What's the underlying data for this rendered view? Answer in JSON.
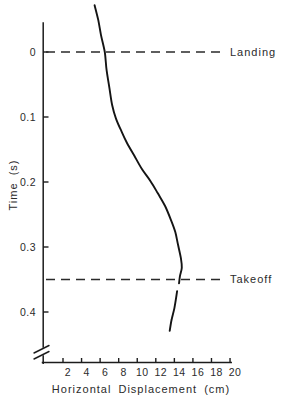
{
  "figure": {
    "kind": "scanned-biomechanics-line-graph",
    "background": "#ffffff",
    "ink_color": "#1c1c1c",
    "text_color": "#2b2b2b"
  },
  "chart_data": {
    "type": "line",
    "title": "",
    "xlabel": "Horizontal Displacement (cm)",
    "ylabel": "Time (s)",
    "xlim": [
      2,
      20
    ],
    "ylim": [
      -0.08,
      0.45
    ],
    "y_axis_direction": "time-increases-downward",
    "y_axis_break_before_x_axis": true,
    "grid": false,
    "legend": "none",
    "x_ticks": [
      2,
      4,
      6,
      8,
      10,
      12,
      14,
      16,
      18,
      20
    ],
    "x_tick_labels": [
      "2",
      "4",
      "6",
      "8",
      "10",
      "12",
      "14",
      "16",
      "18",
      "20"
    ],
    "y_ticks": [
      0,
      0.1,
      0.2,
      0.3,
      0.4
    ],
    "y_tick_labels": [
      "0",
      "0.1",
      "0.2",
      "0.3",
      "0.4"
    ],
    "point_format": [
      "time_s",
      "displacement_cm"
    ],
    "series": [
      {
        "name": "displacement-before-and-during-contact",
        "points": [
          [
            -0.072,
            5.4
          ],
          [
            -0.049,
            5.8
          ],
          [
            -0.026,
            6.1
          ],
          [
            0.0,
            6.5
          ],
          [
            0.028,
            6.7
          ],
          [
            0.055,
            7.0
          ],
          [
            0.082,
            7.3
          ],
          [
            0.102,
            7.7
          ],
          [
            0.122,
            8.3
          ],
          [
            0.14,
            8.9
          ],
          [
            0.16,
            9.7
          ],
          [
            0.18,
            10.5
          ],
          [
            0.198,
            11.4
          ],
          [
            0.217,
            12.2
          ],
          [
            0.237,
            13.0
          ],
          [
            0.257,
            13.6
          ],
          [
            0.277,
            14.1
          ],
          [
            0.297,
            14.4
          ],
          [
            0.317,
            14.7
          ],
          [
            0.332,
            14.8
          ],
          [
            0.345,
            14.6
          ],
          [
            0.356,
            14.5
          ]
        ]
      },
      {
        "name": "displacement-after-takeoff",
        "points": [
          [
            0.368,
            14.3
          ],
          [
            0.394,
            14.0
          ],
          [
            0.412,
            13.7
          ],
          [
            0.429,
            13.5
          ]
        ]
      }
    ],
    "annotations": [
      {
        "label": "Landing",
        "t": 0.0,
        "style": "dashed-horizontal"
      },
      {
        "label": "Takeoff",
        "t": 0.35,
        "style": "dashed-horizontal"
      }
    ]
  }
}
